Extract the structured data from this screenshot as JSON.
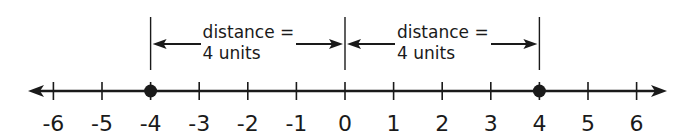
{
  "number_line": {
    "min": -6,
    "max": 6,
    "ticks": [
      {
        "value": -6,
        "label": "-6"
      },
      {
        "value": -5,
        "label": "-5"
      },
      {
        "value": -4,
        "label": "-4"
      },
      {
        "value": -3,
        "label": "-3"
      },
      {
        "value": -2,
        "label": "-2"
      },
      {
        "value": -1,
        "label": "-1"
      },
      {
        "value": 0,
        "label": "0"
      },
      {
        "value": 1,
        "label": "1"
      },
      {
        "value": 2,
        "label": "2"
      },
      {
        "value": 3,
        "label": "3"
      },
      {
        "value": 4,
        "label": "4"
      },
      {
        "value": 5,
        "label": "5"
      },
      {
        "value": 6,
        "label": "6"
      }
    ],
    "points": [
      -4,
      4
    ],
    "arrows_both_ends": true
  },
  "annotations": [
    {
      "from": -4,
      "to": 0,
      "line1": "distance =",
      "line2": "4 units"
    },
    {
      "from": 0,
      "to": 4,
      "line1": "distance =",
      "line2": "4 units"
    }
  ],
  "colors": {
    "ink": "#1a1a1a",
    "background": "#ffffff"
  }
}
